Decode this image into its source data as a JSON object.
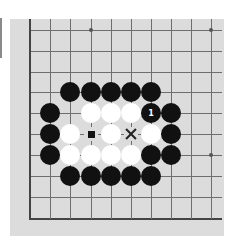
{
  "board": {
    "background": "#dcdcdc",
    "line_color": "#6e6e6e",
    "grid": {
      "cols_x": [
        19,
        40,
        60,
        81,
        101,
        121,
        141,
        161,
        181,
        201
      ],
      "rows_y": [
        11,
        32,
        53,
        73,
        94,
        115,
        136,
        157,
        178,
        199
      ],
      "left_edge_col": 0,
      "bottom_edge_row": 9
    },
    "star_points": [
      {
        "col": 3,
        "row": 0
      },
      {
        "col": 9,
        "row": 0
      },
      {
        "col": 9,
        "row": 6
      }
    ],
    "stones": [
      {
        "col": 2,
        "row": 3,
        "color": "black"
      },
      {
        "col": 3,
        "row": 3,
        "color": "black"
      },
      {
        "col": 4,
        "row": 3,
        "color": "black"
      },
      {
        "col": 5,
        "row": 3,
        "color": "black"
      },
      {
        "col": 6,
        "row": 3,
        "color": "black"
      },
      {
        "col": 1,
        "row": 4,
        "color": "black"
      },
      {
        "col": 3,
        "row": 4,
        "color": "white"
      },
      {
        "col": 4,
        "row": 4,
        "color": "white"
      },
      {
        "col": 5,
        "row": 4,
        "color": "white"
      },
      {
        "col": 6,
        "row": 4,
        "color": "black",
        "label": "1"
      },
      {
        "col": 7,
        "row": 4,
        "color": "black"
      },
      {
        "col": 1,
        "row": 5,
        "color": "black"
      },
      {
        "col": 2,
        "row": 5,
        "color": "white"
      },
      {
        "col": 4,
        "row": 5,
        "color": "white"
      },
      {
        "col": 6,
        "row": 5,
        "color": "white"
      },
      {
        "col": 7,
        "row": 5,
        "color": "black"
      },
      {
        "col": 1,
        "row": 6,
        "color": "black"
      },
      {
        "col": 2,
        "row": 6,
        "color": "white"
      },
      {
        "col": 3,
        "row": 6,
        "color": "white"
      },
      {
        "col": 4,
        "row": 6,
        "color": "white"
      },
      {
        "col": 5,
        "row": 6,
        "color": "white"
      },
      {
        "col": 6,
        "row": 6,
        "color": "black"
      },
      {
        "col": 7,
        "row": 6,
        "color": "black"
      },
      {
        "col": 2,
        "row": 7,
        "color": "black"
      },
      {
        "col": 3,
        "row": 7,
        "color": "black"
      },
      {
        "col": 4,
        "row": 7,
        "color": "black"
      },
      {
        "col": 5,
        "row": 7,
        "color": "black"
      },
      {
        "col": 6,
        "row": 7,
        "color": "black"
      }
    ],
    "markers": [
      {
        "col": 3,
        "row": 5,
        "type": "square",
        "icon": "square-marker-icon"
      },
      {
        "col": 5,
        "row": 5,
        "type": "cross",
        "icon": "x-marker-icon"
      }
    ]
  }
}
